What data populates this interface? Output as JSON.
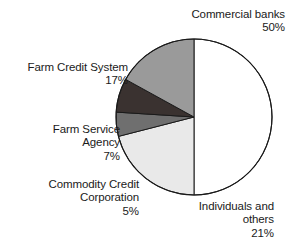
{
  "chart_data": {
    "type": "pie",
    "title": "",
    "subtitle": "",
    "xlabel": "",
    "ylabel": "",
    "grid": false,
    "legend": "none (direct labels with leader-free callouts)",
    "start_angle_deg": 0,
    "direction": "clockwise",
    "center": {
      "x": 194,
      "y": 117
    },
    "radius": 78,
    "total_percent": 100,
    "categories": [
      "Commercial banks",
      "Individuals and others",
      "Commodity Credit Corporation",
      "Farm Service Agency",
      "Farm Credit System"
    ],
    "values": [
      50,
      21,
      5,
      7,
      17
    ],
    "slices": [
      {
        "name": "Commercial banks",
        "label_lines": [
          "Commercial banks",
          "50%"
        ],
        "value": 50,
        "value_text": "50%",
        "fill": "#ffffff",
        "stroke": "#1a1a1a",
        "start_angle_deg": 0,
        "end_angle_deg": 180
      },
      {
        "name": "Individuals and others",
        "label_lines": [
          "Individuals and",
          "others",
          "21%"
        ],
        "value": 21,
        "value_text": "21%",
        "fill": "#e9e9e9",
        "stroke": "#1a1a1a",
        "start_angle_deg": 180,
        "end_angle_deg": 255.6
      },
      {
        "name": "Commodity Credit Corporation",
        "label_lines": [
          "Commodity Credit",
          "Corporation",
          "5%"
        ],
        "value": 5,
        "value_text": "5%",
        "fill": "#6f6f6f",
        "stroke": "#1a1a1a",
        "start_angle_deg": 255.6,
        "end_angle_deg": 273.6
      },
      {
        "name": "Farm Service Agency",
        "label_lines": [
          "Farm Service",
          "Agency",
          "7%"
        ],
        "value": 7,
        "value_text": "7%",
        "fill": "#3a3230",
        "stroke": "#1a1a1a",
        "start_angle_deg": 273.6,
        "end_angle_deg": 298.8
      },
      {
        "name": "Farm Credit System",
        "label_lines": [
          "Farm Credit System",
          "17%"
        ],
        "value": 17,
        "value_text": "17%",
        "fill": "#9a9a9a",
        "stroke": "#1a1a1a",
        "start_angle_deg": 298.8,
        "end_angle_deg": 360
      }
    ],
    "colors": {
      "commercial_banks": "#ffffff",
      "individuals_and_others": "#e9e9e9",
      "commodity_credit_corporation": "#6f6f6f",
      "farm_service_agency": "#3a3230",
      "farm_credit_system": "#9a9a9a",
      "outline": "#1a1a1a",
      "background": "#ffffff",
      "text": "#1a1a1a"
    }
  },
  "labels": {
    "commercial_banks": "Commercial banks\n50%",
    "farm_credit_system": "Farm Credit System\n17%",
    "farm_service_agency": "Farm Service\nAgency\n7%",
    "commodity_credit_corporation": "Commodity Credit\nCorporation\n5%",
    "individuals_and_others": "Individuals and\nothers\n21%"
  }
}
